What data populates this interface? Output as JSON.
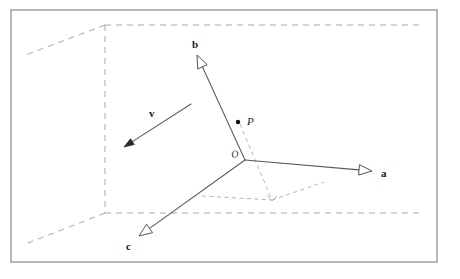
{
  "figure": {
    "kind": "vector-basis-3d-diagram",
    "background_color": "#ffffff",
    "frame": {
      "name": "outer-border",
      "x": 11,
      "y": 10,
      "width": 426,
      "height": 252,
      "stroke": "#8c8c8c",
      "stroke_width": 1.2
    },
    "colors": {
      "solid_line": "#5a5a5a",
      "dashed_line": "#a9a9a9",
      "dashed_projection": "#b5b5b5",
      "label_text": "#1a1a1a",
      "arrow_fill": "#ffffff",
      "arrow_stroke": "#555555",
      "solid_arrow_fill": "#2b2b2b",
      "point_fill": "#111111"
    },
    "origin": {
      "name": "origin",
      "label": "ᵊO",
      "label_text": "O",
      "x": 245,
      "y": 160,
      "label_x": 232,
      "label_y": 158
    },
    "point_p": {
      "name": "point-P",
      "label": "P",
      "dot_x": 238,
      "dot_y": 122,
      "dot_r": 2.2,
      "label_x": 247,
      "label_y": 125
    },
    "vectors": [
      {
        "name": "vector-a",
        "label": "a",
        "from_x": 245,
        "from_y": 160,
        "to_x": 372,
        "to_y": 171,
        "head_style": "hollow",
        "label_x": 381,
        "label_y": 177
      },
      {
        "name": "vector-b",
        "label": "b",
        "from_x": 245,
        "from_y": 160,
        "to_x": 197,
        "to_y": 55,
        "head_style": "hollow",
        "label_x": 192,
        "label_y": 48
      },
      {
        "name": "vector-c",
        "label": "c",
        "from_x": 245,
        "from_y": 160,
        "to_x": 139,
        "to_y": 236,
        "head_style": "hollow",
        "label_x": 126,
        "label_y": 250
      },
      {
        "name": "vector-v",
        "label": "v",
        "from_x": 191,
        "from_y": 104,
        "to_x": 124,
        "to_y": 147,
        "head_style": "solid",
        "label_x": 149,
        "label_y": 117
      }
    ],
    "box": {
      "name": "dashed-bounding-box",
      "corner_x": 105,
      "corner_y": 25,
      "segments": [
        {
          "name": "box-top-edge",
          "x1": 105,
          "y1": 25,
          "x2": 422,
          "y2": 25
        },
        {
          "name": "box-vertical-edge",
          "x1": 105,
          "y1": 25,
          "x2": 105,
          "y2": 213
        },
        {
          "name": "box-floor-edge",
          "x1": 105,
          "y1": 213,
          "x2": 420,
          "y2": 213
        },
        {
          "name": "box-depth-upper",
          "x1": 105,
          "y1": 25,
          "x2": 23,
          "y2": 56
        },
        {
          "name": "box-depth-lower",
          "x1": 105,
          "y1": 213,
          "x2": 23,
          "y2": 245
        }
      ]
    },
    "projection": {
      "name": "projection-construction",
      "foot_x": 272,
      "foot_y": 200,
      "segments": [
        {
          "name": "projection-p-to-foot",
          "x1": 240,
          "y1": 124,
          "x2": 272,
          "y2": 200
        },
        {
          "name": "projection-foot-to-a",
          "x1": 272,
          "y1": 200,
          "x2": 324,
          "y2": 182
        },
        {
          "name": "projection-origin-to-c",
          "x1": 202,
          "y1": 196,
          "x2": 272,
          "y2": 200
        }
      ],
      "arrow_tip_x": 272,
      "arrow_tip_y": 201
    }
  }
}
